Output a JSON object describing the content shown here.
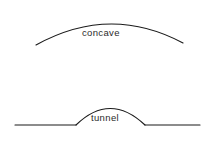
{
  "figure": {
    "background_color": "#ffffff",
    "stroke_color": "#1a1a1a",
    "text_color": "#2b2b2b",
    "width": 212,
    "height": 142
  },
  "shapes": {
    "concave_arc": {
      "label": "concave",
      "path": "M 36 45 Q 110 4 183 43",
      "description": "shallow upward arc"
    },
    "tunnel": {
      "label": "tunnel",
      "ground_left_path": "M 15 125 L 76 125",
      "ground_right_path": "M 145 125 L 200 125",
      "arch_path": "M 76 125 Q 110 92 145 125",
      "description": "horizontal ground line with semicircular arch"
    }
  },
  "labels": {
    "concave": "concave",
    "tunnel": "tunnel"
  }
}
